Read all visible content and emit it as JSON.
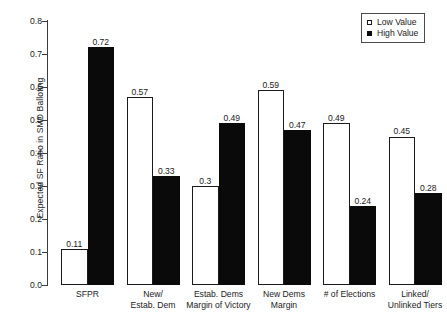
{
  "chart_data": {
    "type": "bar",
    "title": "",
    "xlabel": "",
    "ylabel": "Expected SF Ratio in SMD Balloting",
    "ylim": [
      0.0,
      0.8
    ],
    "grid": false,
    "legend_position": "top-right",
    "ytick_labels": [
      "0.8",
      "0.7",
      "0.6",
      "0.5",
      "0.4",
      "0.3",
      "0.2",
      "0.1",
      "0.0"
    ],
    "ytick_values": [
      0.8,
      0.7,
      0.6,
      0.5,
      0.4,
      0.3,
      0.2,
      0.1,
      0.0
    ],
    "categories": [
      "SFPR",
      "New/ Estab. Dem",
      "Estab. Dems Margin of Victory",
      "New Dems Margin",
      "# of Elections",
      "Linked/ Unlinked Tiers"
    ],
    "category_lines": [
      [
        "SFPR"
      ],
      [
        "New/",
        "Estab. Dem"
      ],
      [
        "Estab. Dems",
        "Margin of Victory"
      ],
      [
        "New Dems",
        "Margin"
      ],
      [
        "# of Elections"
      ],
      [
        "Linked/",
        "Unlinked Tiers"
      ]
    ],
    "series": [
      {
        "name": "Low Value",
        "color": "#ffffff",
        "edge_color": "#1a1a1a",
        "values": [
          0.11,
          0.57,
          0.3,
          0.59,
          0.49,
          0.45
        ],
        "labels": [
          "0.11",
          "0.57",
          "0.3",
          "0.59",
          "0.49",
          "0.45"
        ]
      },
      {
        "name": "High Value",
        "color": "#0a0a0a",
        "edge_color": "#0a0a0a",
        "values": [
          0.72,
          0.33,
          0.49,
          0.47,
          0.24,
          0.28
        ],
        "labels": [
          "0.72",
          "0.33",
          "0.49",
          "0.47",
          "0.24",
          "0.28"
        ]
      }
    ]
  },
  "legend": {
    "items": [
      {
        "label": "Low Value",
        "swatch": "open-square-icon"
      },
      {
        "label": "High Value",
        "swatch": "filled-square-icon"
      }
    ]
  }
}
